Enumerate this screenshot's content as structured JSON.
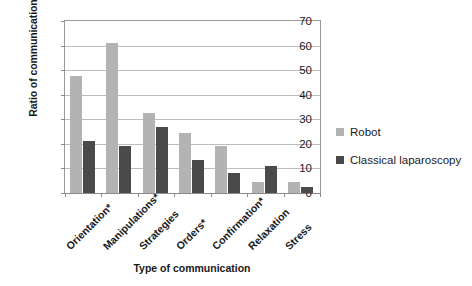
{
  "chart_data": {
    "type": "bar",
    "title": "",
    "xlabel": "Type of communication",
    "ylabel": "Ratio of communication",
    "ylim": [
      0,
      70
    ],
    "ytick_step": 10,
    "yticks": [
      0,
      10,
      20,
      30,
      40,
      50,
      60,
      70
    ],
    "grid": true,
    "legend_position": "right",
    "categories": [
      "Orientation*",
      "Manipulations*",
      "Strategies",
      "Orders*",
      "Confirmation*",
      "Relaxation",
      "Stress"
    ],
    "series": [
      {
        "name": "Robot",
        "color": "#b3b3b3",
        "values": [
          47.5,
          61,
          32.5,
          24.5,
          19,
          4.5,
          4.5
        ]
      },
      {
        "name": "Classical laparoscopy",
        "color": "#4a4a4a",
        "values": [
          21,
          19,
          27,
          13.5,
          8,
          11,
          2.5
        ]
      }
    ]
  },
  "legend": {
    "items": [
      {
        "label": "Robot",
        "swatch": "robot"
      },
      {
        "label": "Classical laparoscopy",
        "swatch": "lap"
      }
    ]
  },
  "axes": {
    "y_title": "Ratio of communication",
    "x_title": "Type of communication",
    "y_ticks": [
      "0",
      "10",
      "20",
      "30",
      "40",
      "50",
      "60",
      "70"
    ]
  },
  "colors": {
    "robot": "#b3b3b3",
    "laparoscopy": "#4a4a4a",
    "gridline": "#bdbdbd",
    "axis": "#8a8a8a",
    "text": "#1a1a1a",
    "background": "#ffffff"
  }
}
